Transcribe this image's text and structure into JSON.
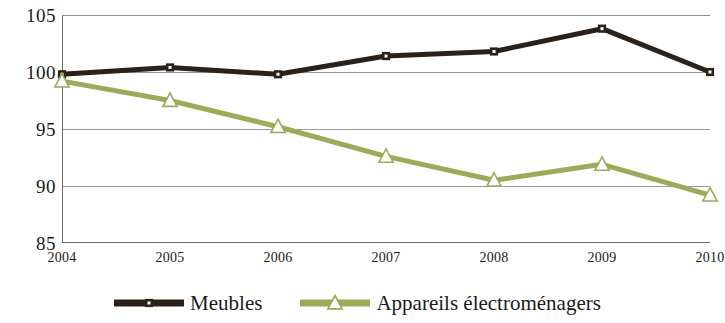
{
  "chart_data": {
    "type": "line",
    "title": "",
    "subtitle": "",
    "xlabel": "",
    "ylabel": "",
    "categories": [
      "2004",
      "2005",
      "2006",
      "2007",
      "2008",
      "2009",
      "2010"
    ],
    "x": [
      2004,
      2005,
      2006,
      2007,
      2008,
      2009,
      2010
    ],
    "series": [
      {
        "name": "Meubles",
        "color": "#2b2118",
        "marker": "square",
        "marker_fill": "#ffffff",
        "values": [
          99.8,
          100.4,
          99.8,
          101.4,
          101.8,
          103.8,
          100.0
        ]
      },
      {
        "name": "Appareils électroménagers",
        "color": "#9aab5a",
        "marker": "triangle",
        "marker_fill": "#ffffff",
        "values": [
          99.2,
          97.5,
          95.2,
          92.6,
          90.5,
          91.9,
          89.2
        ]
      }
    ],
    "ylim": [
      85,
      105
    ],
    "yticks": [
      85,
      90,
      95,
      100,
      105
    ],
    "ytick_labels": [
      "85",
      "90",
      "95",
      "100",
      "105"
    ],
    "xlim": [
      2004,
      2010
    ],
    "grid": true,
    "grid_axis": "y",
    "legend_position": "bottom",
    "legend": [
      "Meubles",
      "Appareils électroménagers"
    ]
  },
  "legend": {
    "items": [
      {
        "label": "Meubles",
        "icon": "square-marker-icon"
      },
      {
        "label": "Appareils électroménagers",
        "icon": "triangle-marker-icon"
      }
    ]
  }
}
